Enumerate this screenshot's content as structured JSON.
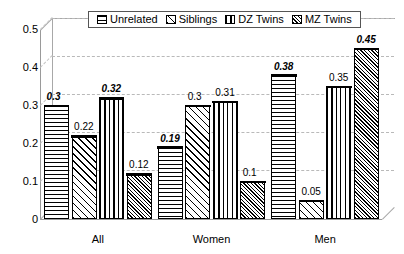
{
  "chart_data": {
    "type": "bar",
    "title": "",
    "xlabel": "",
    "ylabel": "",
    "ylim": [
      0,
      0.5
    ],
    "yticks": [
      "0",
      "0.1",
      "0.2",
      "0.3",
      "0.4",
      "0.5"
    ],
    "grid": true,
    "legend_position": "top-center",
    "categories": [
      "All",
      "Women",
      "Men"
    ],
    "series": [
      {
        "name": "Unrelated",
        "pattern": "horizontal-lines",
        "values": [
          0.3,
          0.19,
          0.38
        ]
      },
      {
        "name": "Siblings",
        "pattern": "diagonal-hatch",
        "values": [
          0.22,
          0.3,
          0.05
        ]
      },
      {
        "name": "DZ Twins",
        "pattern": "vertical-lines",
        "values": [
          0.32,
          0.31,
          0.35
        ]
      },
      {
        "name": "MZ Twins",
        "pattern": "fine-diagonal-hatch",
        "values": [
          0.12,
          0.1,
          0.45
        ]
      }
    ],
    "data_labels": [
      {
        "text": "0.3",
        "emphasis": true,
        "group": 0,
        "series": 0
      },
      {
        "text": "0.22",
        "emphasis": false,
        "group": 0,
        "series": 1
      },
      {
        "text": "0.32",
        "emphasis": true,
        "group": 0,
        "series": 2
      },
      {
        "text": "0.12",
        "emphasis": false,
        "group": 0,
        "series": 3
      },
      {
        "text": "0.19",
        "emphasis": true,
        "group": 1,
        "series": 0
      },
      {
        "text": "0.3",
        "emphasis": false,
        "group": 1,
        "series": 1
      },
      {
        "text": "0.31",
        "emphasis": false,
        "group": 1,
        "series": 2
      },
      {
        "text": "0.1",
        "emphasis": false,
        "group": 1,
        "series": 3
      },
      {
        "text": "0.38",
        "emphasis": true,
        "group": 2,
        "series": 0
      },
      {
        "text": "0.05",
        "emphasis": false,
        "group": 2,
        "series": 1
      },
      {
        "text": "0.35",
        "emphasis": false,
        "group": 2,
        "series": 2
      },
      {
        "text": "0.45",
        "emphasis": true,
        "group": 2,
        "series": 3
      }
    ]
  },
  "colors": {
    "axis": "#9a9a9a",
    "grid": "#b9b9b9",
    "bar_outline": "#000000",
    "bar_fill": "#ffffff",
    "background": "#ffffff"
  }
}
